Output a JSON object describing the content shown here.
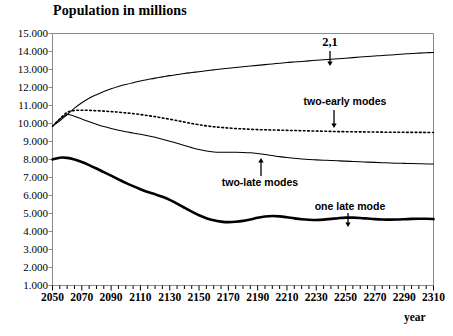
{
  "chart_data": {
    "type": "line",
    "title": "Population in millions",
    "xlabel": "year",
    "ylabel": "",
    "xlim": [
      2050,
      2310
    ],
    "ylim": [
      1000,
      15000
    ],
    "grid": false,
    "legend_position": "inline-annotations",
    "x_tick_labels": [
      "2050",
      "2070",
      "2090",
      "2110",
      "2130",
      "2150",
      "2170",
      "2190",
      "2210",
      "2230",
      "2250",
      "2270",
      "2290",
      "2310"
    ],
    "x_tick_step": 20,
    "x_minor_tick_step": 5,
    "y_tick_labels": [
      "15.000",
      "14.000",
      "13.000",
      "12.000",
      "11.000",
      "10.000",
      "9.000",
      "8.000",
      "7.000",
      "6.000",
      "5.000",
      "4.000",
      "3.000",
      "2.000",
      "1.000"
    ],
    "y_tick_values": [
      15000,
      14000,
      13000,
      12000,
      11000,
      10000,
      9000,
      8000,
      7000,
      6000,
      5000,
      4000,
      3000,
      2000,
      1000
    ],
    "x": [
      2050,
      2055,
      2060,
      2065,
      2070,
      2075,
      2080,
      2085,
      2090,
      2095,
      2100,
      2105,
      2110,
      2115,
      2120,
      2125,
      2130,
      2135,
      2140,
      2145,
      2150,
      2155,
      2160,
      2165,
      2170,
      2175,
      2180,
      2185,
      2190,
      2195,
      2200,
      2205,
      2210,
      2215,
      2220,
      2225,
      2230,
      2235,
      2240,
      2245,
      2250,
      2255,
      2260,
      2265,
      2270,
      2275,
      2280,
      2285,
      2290,
      2295,
      2300,
      2305,
      2310
    ],
    "series": [
      {
        "name": "2,1",
        "style": "solid-thin",
        "color": "#000000",
        "values": [
          9850,
          10150,
          10500,
          10850,
          11150,
          11400,
          11600,
          11780,
          11930,
          12060,
          12170,
          12270,
          12360,
          12440,
          12520,
          12590,
          12660,
          12720,
          12780,
          12830,
          12880,
          12930,
          12980,
          13030,
          13070,
          13110,
          13150,
          13190,
          13230,
          13270,
          13310,
          13350,
          13390,
          13420,
          13450,
          13480,
          13510,
          13540,
          13570,
          13600,
          13630,
          13660,
          13690,
          13720,
          13750,
          13780,
          13800,
          13830,
          13860,
          13890,
          13910,
          13930,
          13950
        ]
      },
      {
        "name": "two-early modes",
        "style": "dotted",
        "color": "#000000",
        "values": [
          9850,
          10250,
          10620,
          10720,
          10740,
          10730,
          10710,
          10690,
          10660,
          10630,
          10590,
          10550,
          10500,
          10440,
          10380,
          10310,
          10240,
          10160,
          10080,
          10000,
          9930,
          9870,
          9820,
          9780,
          9750,
          9720,
          9700,
          9680,
          9660,
          9650,
          9640,
          9630,
          9620,
          9610,
          9600,
          9590,
          9580,
          9570,
          9560,
          9550,
          9545,
          9540,
          9535,
          9530,
          9525,
          9520,
          9515,
          9512,
          9510,
          9508,
          9506,
          9504,
          9502
        ]
      },
      {
        "name": "two-late modes",
        "style": "solid-thin",
        "color": "#000000",
        "values": [
          9850,
          10250,
          10500,
          10400,
          10250,
          10100,
          9960,
          9830,
          9720,
          9620,
          9540,
          9470,
          9400,
          9320,
          9230,
          9130,
          9020,
          8900,
          8780,
          8660,
          8550,
          8470,
          8420,
          8400,
          8400,
          8400,
          8390,
          8370,
          8330,
          8280,
          8220,
          8160,
          8110,
          8070,
          8030,
          8000,
          7980,
          7960,
          7940,
          7925,
          7910,
          7890,
          7870,
          7855,
          7840,
          7825,
          7810,
          7795,
          7785,
          7775,
          7765,
          7755,
          7745
        ]
      },
      {
        "name": "one late mode",
        "style": "solid-thick",
        "color": "#000000",
        "values": [
          8000,
          8100,
          8090,
          8000,
          7860,
          7690,
          7500,
          7300,
          7100,
          6900,
          6700,
          6520,
          6350,
          6200,
          6070,
          5930,
          5760,
          5550,
          5320,
          5100,
          4900,
          4740,
          4620,
          4550,
          4520,
          4540,
          4590,
          4670,
          4760,
          4830,
          4860,
          4840,
          4790,
          4730,
          4680,
          4650,
          4640,
          4660,
          4700,
          4740,
          4770,
          4770,
          4750,
          4720,
          4690,
          4670,
          4660,
          4665,
          4680,
          4700,
          4710,
          4705,
          4690
        ]
      }
    ],
    "annotations": [
      {
        "label": "2,1",
        "target_series": "2,1",
        "arrow": "down"
      },
      {
        "label": "two-early modes",
        "target_series": "two-early modes",
        "arrow": "down"
      },
      {
        "label": "two-late modes",
        "target_series": "two-late modes",
        "arrow": "up"
      },
      {
        "label": "one late mode",
        "target_series": "one late mode",
        "arrow": "down"
      }
    ]
  }
}
